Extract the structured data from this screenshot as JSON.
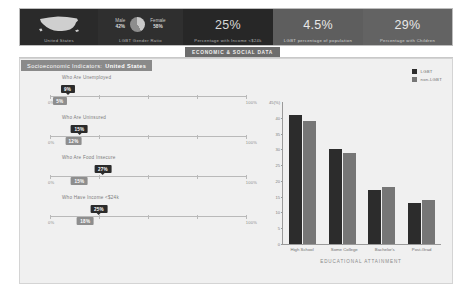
{
  "kpis": [
    {
      "id": "region",
      "icon": "us-map-icon",
      "value": "",
      "caption": "United States"
    },
    {
      "id": "gender-ratio",
      "icon": "pie-chart-icon",
      "value": "",
      "caption": "LGBT Gender Ratio",
      "male_label": "Male",
      "male_value": "42%",
      "female_label": "Female",
      "female_value": "58%"
    },
    {
      "id": "income-under-24k",
      "value": "25%",
      "caption": "Percentage with Income <$24k"
    },
    {
      "id": "lgbt-population",
      "value": "4.5%",
      "caption": "LGBT percentage of population"
    },
    {
      "id": "with-children",
      "value": "29%",
      "caption": "Percentage with Children"
    }
  ],
  "tab": {
    "label": "ECONOMIC & SOCIAL DATA"
  },
  "panel": {
    "title": "Socioeconomic Indicators:",
    "subject": "United States"
  },
  "sliders": [
    {
      "label": "Who Are Unemployed",
      "lgbt": "9%",
      "lgbt_pct": 9,
      "non": "5%",
      "non_pct": 5,
      "min_label": "0%",
      "max_label": "100%"
    },
    {
      "label": "Who Are Uninsured",
      "lgbt": "15%",
      "lgbt_pct": 15,
      "non": "12%",
      "non_pct": 12,
      "min_label": "0%",
      "max_label": "100%"
    },
    {
      "label": "Who Are Food Insecure",
      "lgbt": "27%",
      "lgbt_pct": 27,
      "non": "15%",
      "non_pct": 15,
      "min_label": "0%",
      "max_label": "100%"
    },
    {
      "label": "Who Have Income <$24k",
      "lgbt": "25%",
      "lgbt_pct": 25,
      "non": "18%",
      "non_pct": 18,
      "min_label": "0%",
      "max_label": "100%"
    }
  ],
  "legend": [
    {
      "name": "LGBT",
      "color": "#2c2c2c"
    },
    {
      "name": "non-LGBT",
      "color": "#767676"
    }
  ],
  "colors": {
    "lgbt": "#2c2c2c",
    "non_lgbt": "#767676",
    "panel_bg": "#f0f0f0",
    "accent": "#8a8a8a"
  },
  "chart_data": {
    "type": "bar",
    "title": "",
    "xlabel": "EDUCATIONAL ATTAINMENT",
    "ylabel": "45(%)",
    "categories": [
      "High School",
      "Some College",
      "Bachelor's",
      "Post-Grad"
    ],
    "series": [
      {
        "name": "LGBT",
        "values": [
          41,
          30,
          17,
          13
        ]
      },
      {
        "name": "non-LGBT",
        "values": [
          39,
          29,
          18,
          14
        ]
      }
    ],
    "ylim": [
      0,
      45
    ],
    "yticks": [
      0,
      5,
      10,
      15,
      20,
      25,
      30,
      35,
      40
    ],
    "ytick_labels": [
      "0",
      "5",
      "10",
      "15",
      "20",
      "25",
      "30",
      "35",
      "40"
    ],
    "y_top_label": "45(%)",
    "grid": false,
    "legend_position": "top-right"
  }
}
